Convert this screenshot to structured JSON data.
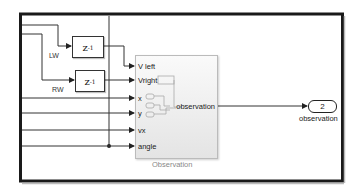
{
  "diagram": {
    "type": "simulink-subsystem",
    "frame_color": "#1a1a1a",
    "signal_color": "#333333",
    "signals": {
      "lw": "LW",
      "rw": "RW"
    },
    "delay_blocks": [
      {
        "id": "unit-delay-lw",
        "label": "z",
        "exponent": "-1"
      },
      {
        "id": "unit-delay-rw",
        "label": "z",
        "exponent": "-1"
      }
    ],
    "observation_block": {
      "name": "Observation",
      "inputs": [
        "V left",
        "Vright",
        "x",
        "y",
        "vx",
        "angle"
      ],
      "output": "observation"
    },
    "outport": {
      "number": "2",
      "label": "observation"
    }
  }
}
